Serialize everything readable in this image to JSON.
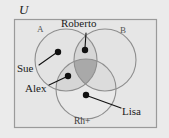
{
  "figure": {
    "type": "venn-diagram",
    "width": 169,
    "height": 138,
    "background_color": "#ebebeb",
    "universe_label": "U",
    "frame": {
      "name": "universal-set-rectangle",
      "x": 14,
      "y": 19,
      "width": 143,
      "height": 109,
      "stroke_color": "#9a9a9a",
      "fill_color": "#e6e6e6"
    }
  },
  "sets": [
    {
      "id": "A",
      "label": "A",
      "label_x": 41,
      "label_y": 30,
      "cx": 66,
      "cy": 60,
      "r": 31,
      "fill_color": "#e2e2e2",
      "stroke_color": "#8e8e8e"
    },
    {
      "id": "B",
      "label": "B",
      "label_x": 124,
      "label_y": 31,
      "cx": 105,
      "cy": 60,
      "r": 31,
      "fill_color": "#e2e2e2",
      "stroke_color": "#8e8e8e"
    },
    {
      "id": "Rh",
      "label": "Rh+",
      "label_x": 84,
      "label_y": 122,
      "cx": 86,
      "cy": 89,
      "r": 30,
      "fill_color": "#e2e2e2",
      "stroke_color": "#8e8e8e"
    }
  ],
  "shading": {
    "pair_overlap_color": "#d2d2d2",
    "triple_overlap_color": "#a9a9a9"
  },
  "elements": [
    {
      "id": "roberto",
      "name": "Roberto",
      "label": "Roberto",
      "point_x": 85,
      "point_y": 50,
      "label_x": 87,
      "label_y": 24,
      "leader_from_x": 86,
      "leader_from_y": 33,
      "region": "A and B only"
    },
    {
      "id": "sue",
      "name": "Sue",
      "label": "Sue",
      "point_x": 58,
      "point_y": 52,
      "label_x": 29,
      "label_y": 69,
      "leader_from_x": 38,
      "leader_from_y": 64,
      "region": "A only"
    },
    {
      "id": "alex",
      "name": "Alex",
      "label": "Alex",
      "point_x": 68,
      "point_y": 76,
      "label_x": 36,
      "label_y": 89,
      "leader_from_x": 48,
      "leader_from_y": 85,
      "region": "A and Rh+ only"
    },
    {
      "id": "lisa",
      "name": "Lisa",
      "label": "Lisa",
      "point_x": 86,
      "point_y": 95,
      "label_x": 130,
      "label_y": 112,
      "leader_from_x": 120,
      "leader_from_y": 108,
      "region": "Rh+ only"
    }
  ],
  "style": {
    "dot_color": "#111111",
    "dot_radius": 3.1,
    "leader_color": "#111111",
    "leader_width": 1.1,
    "text_color": "#1a1a1a"
  }
}
